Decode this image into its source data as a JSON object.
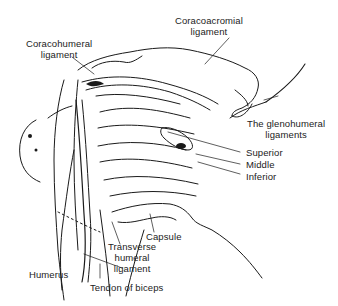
{
  "figure": {
    "labels": {
      "coracohumeral": {
        "line1": "Coracohumeral",
        "line2": "ligament"
      },
      "coracoacromial": {
        "line1": "Coracoacromial",
        "line2": "ligament"
      },
      "glenohumeral": {
        "line1": "The glenohumeral",
        "line2": "ligaments"
      },
      "superior": "Superior",
      "middle": "Middle",
      "inferior": "Inferior",
      "capsule": "Capsule",
      "transverse": {
        "line1": "Transverse",
        "line2": "humeral",
        "line3": "ligament"
      },
      "humerus": "Humerus",
      "tendon": "Tendon of biceps"
    },
    "colors": {
      "ink": "#1a1a1a",
      "background": "#ffffff"
    }
  }
}
